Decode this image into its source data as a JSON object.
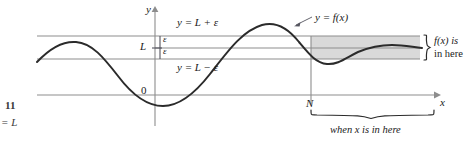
{
  "figure": {
    "kind": "calculus-limit-at-infinity-epsilon-N-diagram",
    "margin_caption": {
      "line1": "11",
      "line2": "= L"
    },
    "axes": {
      "y_axis_label": "y",
      "x_axis_label": "x",
      "origin_label": "0",
      "limit_label": "L",
      "n_label": "N"
    },
    "lines": [
      {
        "name": "upper-bound-line",
        "label": "y = L + ε",
        "value": "L + ε"
      },
      {
        "name": "limit-line",
        "label": "L",
        "value": "L"
      },
      {
        "name": "lower-bound-line",
        "label": "y = L − ε",
        "value": "L − ε"
      }
    ],
    "epsilon_labels": {
      "upper": "ε",
      "lower": "ε"
    },
    "curve_label": "y = f(x)",
    "annotations": {
      "right_brace_line1": "f(x) is",
      "right_brace_line2": "in here",
      "bottom_brace": "when x is in here"
    },
    "colors": {
      "curve": "#2b2b2b",
      "guide_line": "#8d8d8d",
      "axis": "#8d8d8d",
      "band_fill": "#d9d9d9",
      "text": "#1a1a1a",
      "margin_text": "#3a3a3a",
      "background": "#ffffff"
    },
    "geometry": {
      "y_axis_x": 155,
      "x_axis_y": 95,
      "line_upper_y": 36,
      "line_limit_y": 48,
      "line_lower_y": 59,
      "n_x": 311,
      "band_right_x": 420,
      "x_arrow_end": 438
    }
  }
}
